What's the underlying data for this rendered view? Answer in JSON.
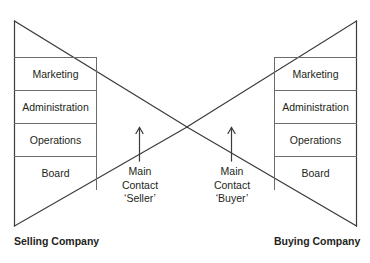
{
  "diagram": {
    "type": "bowtie-contact-diagram",
    "stroke_color": "#3b3b3b",
    "text_color": "#231f20",
    "background_color": "#ffffff"
  },
  "left": {
    "company_label": "Selling Company",
    "departments": [
      {
        "label": "Marketing"
      },
      {
        "label": "Administration"
      },
      {
        "label": "Operations"
      },
      {
        "label": "Board"
      }
    ],
    "contact": {
      "line1": "Main",
      "line2": "Contact",
      "line3": "‘Seller’"
    }
  },
  "right": {
    "company_label": "Buying Company",
    "departments": [
      {
        "label": "Marketing"
      },
      {
        "label": "Administration"
      },
      {
        "label": "Operations"
      },
      {
        "label": "Board"
      }
    ],
    "contact": {
      "line1": "Main",
      "line2": "Contact",
      "line3": "‘Buyer’"
    }
  }
}
